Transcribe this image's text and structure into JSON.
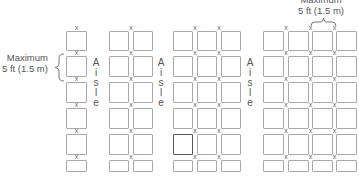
{
  "diagram": {
    "title": "",
    "left_label": {
      "line1": "Maximum",
      "line2": "5 ft (1.5 m)"
    },
    "top_right_label": {
      "line1": "Maximum",
      "line2": "5 ft (1.5 m)"
    },
    "aisle_label": [
      "A",
      "i",
      "s",
      "l",
      "e"
    ],
    "marker": "x",
    "columns": [
      {
        "name": "single-row",
        "boxes_across": 1,
        "rows": 6
      },
      {
        "name": "double-row",
        "boxes_across": 2,
        "rows": 6
      },
      {
        "name": "triple-row",
        "boxes_across": 3,
        "rows": 6,
        "highlighted": {
          "row": 5,
          "col": 1
        }
      },
      {
        "name": "quad-row",
        "boxes_across": 4,
        "rows": 6
      }
    ],
    "colors": {
      "box_border": "#a9a9a9",
      "highlight_border": "#555555",
      "text": "#555555"
    }
  }
}
